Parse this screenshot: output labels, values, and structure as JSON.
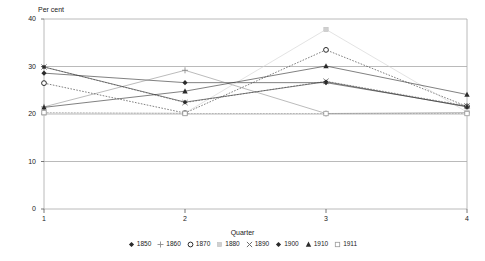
{
  "chart_data": {
    "type": "line",
    "title": "",
    "ylabel": "Per cent",
    "xlabel": "Quarter",
    "categories": [
      "1",
      "2",
      "3",
      "4"
    ],
    "x": [
      1,
      2,
      3,
      4
    ],
    "ylim": [
      0,
      40
    ],
    "yticks": [
      0,
      10,
      20,
      30,
      40
    ],
    "ytick_labels": [
      "0",
      "10",
      "20",
      "30",
      "40"
    ],
    "xticks": [
      1,
      2,
      3,
      4
    ],
    "xtick_labels": [
      "1",
      "2",
      "3",
      "4"
    ],
    "grid": true,
    "legend_position": "bottom",
    "series": [
      {
        "name": "1850",
        "marker": "diamond-filled",
        "color": "#2b2b2b",
        "values": [
          28.6,
          26.6,
          26.6,
          21.6
        ]
      },
      {
        "name": "1860",
        "marker": "plus",
        "color": "#8c8c8c",
        "values": [
          21.5,
          29.2,
          20.1,
          20.3
        ]
      },
      {
        "name": "1870",
        "marker": "circle-open",
        "color": "#2b2b2b",
        "values": [
          26.5,
          20.2,
          33.5,
          21.6
        ]
      },
      {
        "name": "1880",
        "marker": "square-filled-light",
        "color": "#d0d0d0",
        "values": [
          20.2,
          20.2,
          37.8,
          20.4
        ]
      },
      {
        "name": "1890",
        "marker": "cross",
        "color": "#6f6f6f",
        "values": [
          29.9,
          22.4,
          26.9,
          21.7
        ]
      },
      {
        "name": "1900",
        "marker": "diamond-filled-small",
        "color": "#2b2b2b",
        "values": [
          29.9,
          22.5,
          26.8,
          21.5
        ]
      },
      {
        "name": "1910",
        "marker": "triangle-filled",
        "color": "#2b2b2b",
        "values": [
          21.4,
          24.8,
          30.1,
          24.1
        ]
      },
      {
        "name": "1911",
        "marker": "square-open",
        "color": "#9a9a9a",
        "values": [
          20.3,
          20.1,
          20.1,
          20.1
        ]
      }
    ]
  }
}
